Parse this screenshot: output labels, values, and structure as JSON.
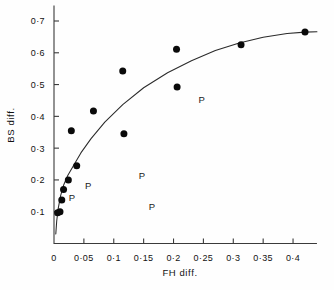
{
  "chart_data": {
    "type": "scatter",
    "title": "",
    "xlabel": "FH diff.",
    "ylabel": "BS diff.",
    "xlim": [
      0,
      0.44
    ],
    "ylim": [
      0,
      0.73
    ],
    "grid": false,
    "legend": null,
    "x_ticks": [
      0,
      0.05,
      0.1,
      0.15,
      0.2,
      0.25,
      0.3,
      0.35,
      0.4
    ],
    "x_tick_labels": [
      "0",
      "0·05",
      "0·1",
      "0·15",
      "0·2",
      "0·25",
      "0·3",
      "0·35",
      "0·4"
    ],
    "y_ticks": [
      0.1,
      0.2,
      0.3,
      0.4,
      0.5,
      0.6,
      0.7
    ],
    "y_tick_labels": [
      "0·1",
      "0·2",
      "0·3",
      "0·4",
      "0·5",
      "0·6",
      "0·7"
    ],
    "series": [
      {
        "name": "observed points",
        "marker": "filled-circle",
        "color": "#0a0a0a",
        "points": [
          {
            "x": 0.006,
            "y": 0.097
          },
          {
            "x": 0.01,
            "y": 0.1
          },
          {
            "x": 0.013,
            "y": 0.137
          },
          {
            "x": 0.016,
            "y": 0.17
          },
          {
            "x": 0.024,
            "y": 0.2
          },
          {
            "x": 0.029,
            "y": 0.355
          },
          {
            "x": 0.038,
            "y": 0.245
          },
          {
            "x": 0.066,
            "y": 0.417
          },
          {
            "x": 0.115,
            "y": 0.543
          },
          {
            "x": 0.117,
            "y": 0.345
          },
          {
            "x": 0.205,
            "y": 0.611
          },
          {
            "x": 0.206,
            "y": 0.492
          },
          {
            "x": 0.313,
            "y": 0.625
          },
          {
            "x": 0.42,
            "y": 0.665
          }
        ]
      },
      {
        "name": "fitted curve",
        "marker": "line",
        "color": "#2a2a2a",
        "points": [
          {
            "x": 0.003,
            "y": 0.03
          },
          {
            "x": 0.0045,
            "y": 0.07
          },
          {
            "x": 0.007,
            "y": 0.11
          },
          {
            "x": 0.011,
            "y": 0.15
          },
          {
            "x": 0.016,
            "y": 0.183
          },
          {
            "x": 0.023,
            "y": 0.214
          },
          {
            "x": 0.032,
            "y": 0.243
          },
          {
            "x": 0.045,
            "y": 0.285
          },
          {
            "x": 0.062,
            "y": 0.33
          },
          {
            "x": 0.085,
            "y": 0.382
          },
          {
            "x": 0.115,
            "y": 0.437
          },
          {
            "x": 0.15,
            "y": 0.49
          },
          {
            "x": 0.19,
            "y": 0.537
          },
          {
            "x": 0.23,
            "y": 0.575
          },
          {
            "x": 0.27,
            "y": 0.607
          },
          {
            "x": 0.31,
            "y": 0.631
          },
          {
            "x": 0.35,
            "y": 0.649
          },
          {
            "x": 0.39,
            "y": 0.661
          },
          {
            "x": 0.42,
            "y": 0.665
          },
          {
            "x": 0.44,
            "y": 0.666
          }
        ]
      },
      {
        "name": "P annotations",
        "marker": "text-P",
        "label": "P",
        "color": "#1a1a1a",
        "points": [
          {
            "x": 0.03,
            "y": 0.143
          },
          {
            "x": 0.057,
            "y": 0.183
          },
          {
            "x": 0.147,
            "y": 0.213
          },
          {
            "x": 0.164,
            "y": 0.115
          },
          {
            "x": 0.247,
            "y": 0.452
          }
        ]
      }
    ]
  },
  "annotations": {
    "p_label_text": "P"
  }
}
